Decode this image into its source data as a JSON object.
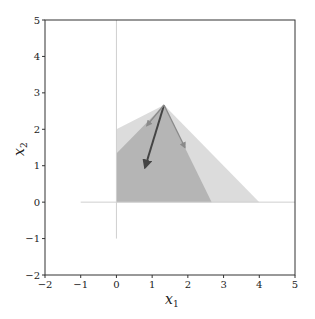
{
  "chart_data": {
    "type": "area",
    "title": "",
    "xlabel": "x_1",
    "ylabel": "x_2",
    "xlim": [
      -2,
      5
    ],
    "ylim": [
      -2,
      5
    ],
    "xticks": [
      -2,
      -1,
      0,
      1,
      2,
      3,
      4,
      5
    ],
    "yticks": [
      -2,
      -1,
      0,
      1,
      2,
      3,
      4,
      5
    ],
    "grid": false,
    "legend": null,
    "reference_lines": [
      {
        "name": "x-axis",
        "from": [
          -1,
          0
        ],
        "to": [
          5,
          0
        ],
        "color": "#cfcfcf"
      },
      {
        "name": "y-axis",
        "from": [
          0,
          -1
        ],
        "to": [
          0,
          5
        ],
        "color": "#cfcfcf"
      }
    ],
    "polygons": [
      {
        "name": "outer-region",
        "color": "#dcdcdc",
        "points": [
          [
            0,
            0
          ],
          [
            0,
            2
          ],
          [
            1.333,
            2.667
          ],
          [
            4,
            0
          ]
        ]
      },
      {
        "name": "inner-region",
        "color": "#b5b5b5",
        "points": [
          [
            0,
            0
          ],
          [
            0,
            1.333
          ],
          [
            1.333,
            2.667
          ],
          [
            2.667,
            0
          ]
        ]
      }
    ],
    "arrows": [
      {
        "name": "gradient-arrow",
        "from": [
          1.333,
          2.667
        ],
        "to": [
          0.8,
          0.95
        ],
        "color": "#444444"
      },
      {
        "name": "left-edge-arrow",
        "from": [
          1.333,
          2.667
        ],
        "to": [
          0.85,
          2.1
        ],
        "color": "#8a8a8a"
      },
      {
        "name": "right-edge-arrow",
        "from": [
          1.333,
          2.667
        ],
        "to": [
          1.92,
          1.5
        ],
        "color": "#8a8a8a"
      }
    ]
  },
  "labels": {
    "xlabel_main": "x",
    "xlabel_sub": "1",
    "ylabel_main": "x",
    "ylabel_sub": "2",
    "xticks": [
      "−2",
      "−1",
      "0",
      "1",
      "2",
      "3",
      "4",
      "5"
    ],
    "yticks": [
      "−2",
      "−1",
      "0",
      "1",
      "2",
      "3",
      "4",
      "5"
    ]
  }
}
